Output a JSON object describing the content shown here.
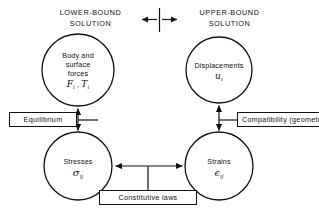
{
  "diagram": {
    "title_left": {
      "line1": "LOWER-BOUND",
      "line2": "SOLUTION"
    },
    "title_right": {
      "line1": "UPPER-BOUND",
      "line2": "SOLUTION"
    },
    "divider": {
      "name": "bidirectional-split-marker"
    },
    "nodes": {
      "body_surface_forces": {
        "line1": "Body and",
        "line2": "surface",
        "line3": "forces",
        "symbol_F": "F",
        "symbol_F_sub": "i",
        "symbol_sep": " , ",
        "symbol_T": "T",
        "symbol_T_sub": "i"
      },
      "displacements": {
        "line1": "Displacements",
        "symbol": "u",
        "symbol_sub": "i"
      },
      "stresses": {
        "line1": "Stresses",
        "symbol": "σ",
        "symbol_sub": "ij"
      },
      "strains": {
        "line1": "Strains",
        "symbol": "ϵ",
        "symbol_sub": "ij"
      }
    },
    "boxes": {
      "equilibrium": "Equilibrium",
      "compatibility": "Compatibility (geometry)",
      "constitutive": "Constitutive laws"
    },
    "colors": {
      "stroke": "#111111",
      "background": "#ffffff"
    }
  }
}
